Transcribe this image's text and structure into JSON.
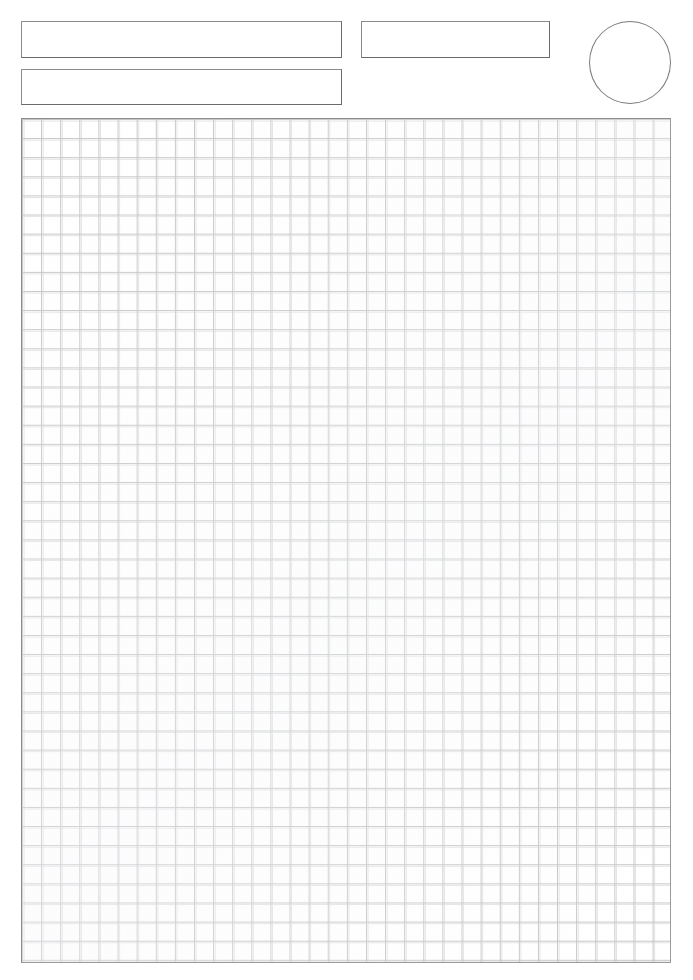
{
  "page": {
    "background_color": "#ffffff",
    "width": 693,
    "height": 980
  },
  "header": {
    "fields": [
      {
        "name": "name-primary",
        "label": "",
        "value": "",
        "placeholder": ""
      },
      {
        "name": "name-secondary",
        "label": "",
        "value": "",
        "placeholder": ""
      },
      {
        "name": "date",
        "label": "",
        "value": "",
        "placeholder": ""
      }
    ],
    "stamp": {
      "name": "score-bubble",
      "value": "",
      "shape": "circle"
    }
  },
  "grid": {
    "name": "graph-paper-grid",
    "columns": 34,
    "rows": 44,
    "cell_size_px": 19,
    "content": "",
    "line_color": "#c3c3c3",
    "faint_line_color": "#e2e2e2",
    "border_color": "#8d8d8d"
  },
  "colors": {
    "paper": "#ffffff",
    "field_border": "#6e6e6e",
    "stamp_border": "#7a7a7a",
    "grid_line": "#c3c3c3",
    "grid_border": "#8d8d8d",
    "ink": "#2b2b2b"
  }
}
